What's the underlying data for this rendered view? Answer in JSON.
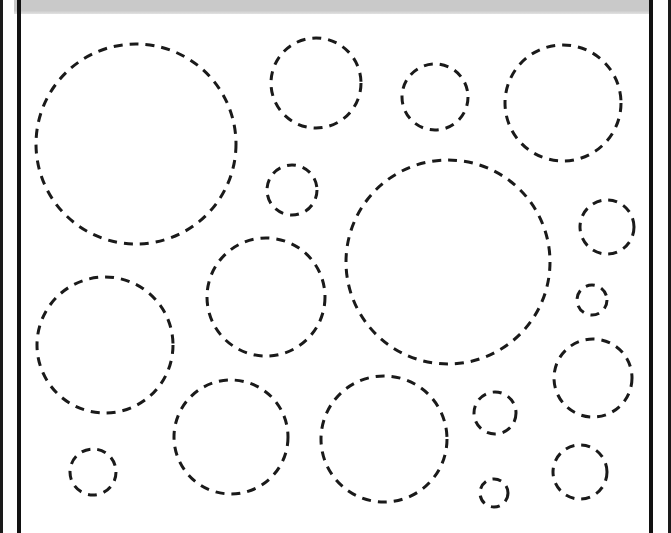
{
  "worksheet": {
    "header_bar_color": "#c9c9c9",
    "frame_color": "#111111",
    "stroke_color": "#1a1a1a",
    "stroke_width": 3,
    "dash_pattern": "9 7",
    "circles": [
      {
        "cx": 136,
        "cy": 144,
        "r": 100
      },
      {
        "cx": 316,
        "cy": 83,
        "r": 45
      },
      {
        "cx": 435,
        "cy": 97,
        "r": 33
      },
      {
        "cx": 563,
        "cy": 103,
        "r": 58
      },
      {
        "cx": 292,
        "cy": 190,
        "r": 25
      },
      {
        "cx": 448,
        "cy": 262,
        "r": 102
      },
      {
        "cx": 607,
        "cy": 227,
        "r": 27
      },
      {
        "cx": 592,
        "cy": 300,
        "r": 15
      },
      {
        "cx": 105,
        "cy": 345,
        "r": 68
      },
      {
        "cx": 266,
        "cy": 297,
        "r": 59
      },
      {
        "cx": 593,
        "cy": 378,
        "r": 39
      },
      {
        "cx": 495,
        "cy": 413,
        "r": 21
      },
      {
        "cx": 231,
        "cy": 437,
        "r": 57
      },
      {
        "cx": 384,
        "cy": 439,
        "r": 63
      },
      {
        "cx": 93,
        "cy": 472,
        "r": 23
      },
      {
        "cx": 580,
        "cy": 472,
        "r": 27
      },
      {
        "cx": 494,
        "cy": 493,
        "r": 14
      }
    ]
  }
}
